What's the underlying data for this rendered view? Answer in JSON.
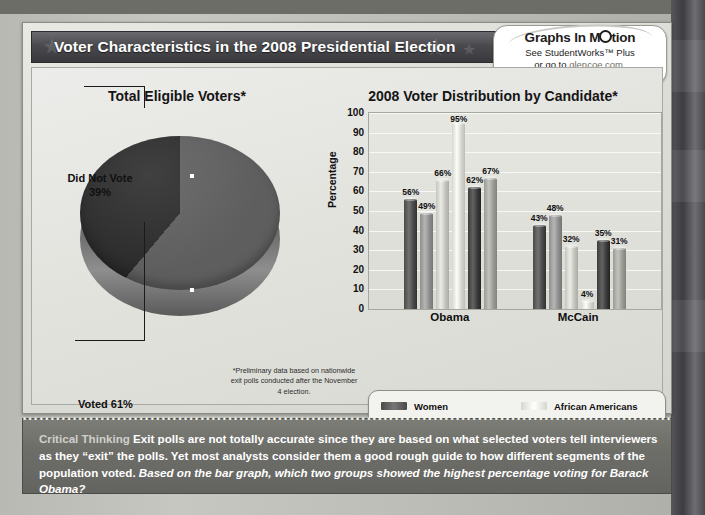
{
  "header": {
    "title": "Voter Characteristics in the 2008 Presidential Election"
  },
  "badge": {
    "title_pre": "Graphs In M",
    "title_post": "tion",
    "line2": "See StudentWorks™ Plus",
    "line3_pre": "or go to ",
    "link": "glencoe.com",
    "line3_post": "."
  },
  "pie_panel": {
    "title": "Total Eligible Voters*",
    "label_did_not_vote": "Did Not Vote",
    "label_did_not_vote_pct": "39%",
    "label_voted": "Voted 61%",
    "footnote": "*Preliminary data based on nationwide exit polls conducted after the November 4 election.",
    "source": "American University Center for the Study of the American Electorate",
    "source_label": "Source:"
  },
  "bar_panel": {
    "title": "2008 Voter Distribution by Candidate*",
    "source": "CNN; estimates based on exit polls",
    "source_label": "Source:"
  },
  "legend": {
    "column1": [
      {
        "label": "Women",
        "color": "#4a4a4a"
      },
      {
        "label": "Men",
        "color": "#8e8e8e"
      },
      {
        "label": "Voters Aged 18–29",
        "color": "#c4c4bf"
      }
    ],
    "column2": [
      {
        "label": "African Americans",
        "color": "#d6d6d1"
      },
      {
        "label": "Asian",
        "color": "#3b3b3b"
      },
      {
        "label": "Hispanics",
        "color": "#9b9b96"
      }
    ]
  },
  "critical_thinking": {
    "label": "Critical Thinking",
    "body": "Exit polls are not totally accurate since they are based on what selected voters tell interviewers as they “exit” the polls. Yet most analysts consider them a good rough guide to how different segments of the population voted.",
    "question": "Based on the bar graph, which two groups showed the highest percentage voting for Barack Obama?"
  },
  "chart_data": [
    {
      "type": "pie",
      "title": "Total Eligible Voters*",
      "labels": [
        "Voted",
        "Did Not Vote"
      ],
      "values": [
        61,
        39
      ],
      "value_labels": [
        "Voted 61%",
        "Did Not Vote 39%"
      ],
      "colors": [
        "#5e5e5e",
        "#2b2b2b"
      ],
      "legend": "none",
      "annotation": "*Preliminary data based on nationwide exit polls conducted after the November 4 election."
    },
    {
      "type": "bar",
      "title": "2008 Voter Distribution by Candidate*",
      "xlabel": "",
      "ylabel": "Percentage",
      "categories": [
        "Obama",
        "McCain"
      ],
      "ylim": [
        0,
        100
      ],
      "yticks": [
        0,
        10,
        20,
        30,
        40,
        50,
        60,
        70,
        80,
        90,
        100
      ],
      "grid": true,
      "legend_position": "bottom",
      "series": [
        {
          "name": "Women",
          "color": "#4a4a4a",
          "values": [
            56,
            43
          ]
        },
        {
          "name": "Men",
          "color": "#8e8e8e",
          "values": [
            49,
            48
          ]
        },
        {
          "name": "Voters Aged 18–29",
          "color": "#c4c4bf",
          "values": [
            66,
            32
          ]
        },
        {
          "name": "African Americans",
          "color": "#d6d6d1",
          "values": [
            95,
            4
          ]
        },
        {
          "name": "Asian",
          "color": "#3b3b3b",
          "values": [
            62,
            35
          ]
        },
        {
          "name": "Hispanics",
          "color": "#9b9b96",
          "values": [
            67,
            31
          ]
        }
      ],
      "data_labels": [
        "56%",
        "49%",
        "66%",
        "95%",
        "62%",
        "67%",
        "43%",
        "48%",
        "32%",
        "4%",
        "35%",
        "31%"
      ]
    }
  ]
}
